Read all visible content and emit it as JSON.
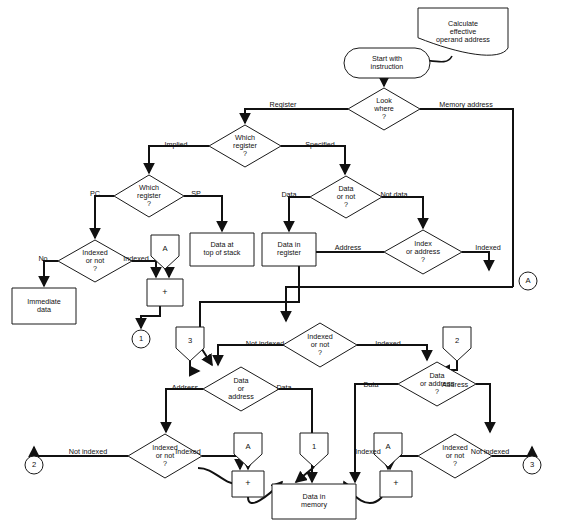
{
  "diagram": {
    "colors": {
      "stroke": "#111111",
      "fill": "#ffffff",
      "text": "#111111"
    },
    "nodes": [
      {
        "id": "note",
        "type": "note",
        "x": 418,
        "y": 8,
        "w": 90,
        "h": 48,
        "lines": [
          "Calculate",
          "effective",
          "operand address"
        ]
      },
      {
        "id": "start",
        "type": "terminator",
        "x": 344,
        "y": 48,
        "w": 86,
        "h": 30,
        "lines": [
          "Start with",
          "instruction"
        ]
      },
      {
        "id": "lookwhere",
        "type": "decision",
        "x": 348,
        "y": 88,
        "w": 72,
        "h": 42,
        "lines": [
          "Look",
          "where",
          "?"
        ]
      },
      {
        "id": "whichreg1",
        "type": "decision",
        "x": 209,
        "y": 125,
        "w": 72,
        "h": 42,
        "lines": [
          "Which",
          "register",
          "?"
        ]
      },
      {
        "id": "whichreg2",
        "type": "decision",
        "x": 114,
        "y": 175,
        "w": 70,
        "h": 42,
        "lines": [
          "Which",
          "register",
          "?"
        ]
      },
      {
        "id": "datornot",
        "type": "decision",
        "x": 310,
        "y": 176,
        "w": 72,
        "h": 42,
        "lines": [
          "Data",
          "or not",
          "?"
        ]
      },
      {
        "id": "idxornot1",
        "type": "decision",
        "x": 58,
        "y": 240,
        "w": 74,
        "h": 42,
        "lines": [
          "Indexed",
          "or not",
          "?"
        ]
      },
      {
        "id": "idxoraddr",
        "type": "decision",
        "x": 384,
        "y": 230,
        "w": 78,
        "h": 44,
        "lines": [
          "Index",
          "or address",
          "?"
        ]
      },
      {
        "id": "idxornot2",
        "type": "decision",
        "x": 283,
        "y": 323,
        "w": 74,
        "h": 44,
        "lines": [
          "Indexed",
          "or not",
          "?"
        ]
      },
      {
        "id": "dataoraddrL",
        "type": "decision",
        "x": 203,
        "y": 367,
        "w": 76,
        "h": 44,
        "lines": [
          "Data",
          "or",
          "address"
        ]
      },
      {
        "id": "dataoraddrR",
        "type": "decision",
        "x": 398,
        "y": 362,
        "w": 78,
        "h": 44,
        "lines": [
          "Data",
          "or address",
          "?"
        ]
      },
      {
        "id": "idxornot3",
        "type": "decision",
        "x": 128,
        "y": 434,
        "w": 74,
        "h": 44,
        "lines": [
          "Indexed",
          "or not",
          "?"
        ]
      },
      {
        "id": "idxornot4",
        "type": "decision",
        "x": 418,
        "y": 434,
        "w": 74,
        "h": 44,
        "lines": [
          "Indexed",
          "or not",
          "?"
        ]
      },
      {
        "id": "immediate",
        "type": "process",
        "x": 12,
        "y": 288,
        "w": 64,
        "h": 36,
        "lines": [
          "Immediate",
          "data"
        ]
      },
      {
        "id": "topstack",
        "type": "process",
        "x": 190,
        "y": 233,
        "w": 64,
        "h": 33,
        "lines": [
          "Data at",
          "top of stack"
        ]
      },
      {
        "id": "datareg",
        "type": "process",
        "x": 262,
        "y": 233,
        "w": 54,
        "h": 33,
        "lines": [
          "Data in",
          "register"
        ]
      },
      {
        "id": "datamem",
        "type": "process",
        "x": 272,
        "y": 484,
        "w": 84,
        "h": 35,
        "lines": [
          "Data in",
          "memory"
        ]
      },
      {
        "id": "adderA",
        "type": "adder",
        "x": 147,
        "y": 279,
        "w": 36,
        "h": 27,
        "lines": [
          "+"
        ]
      },
      {
        "id": "adderB",
        "type": "adder",
        "x": 232,
        "y": 471,
        "w": 32,
        "h": 26,
        "lines": [
          "+"
        ]
      },
      {
        "id": "adderC",
        "type": "adder",
        "x": 380,
        "y": 471,
        "w": 32,
        "h": 26,
        "lines": [
          "+"
        ]
      },
      {
        "id": "regA1",
        "type": "register",
        "x": 151,
        "y": 235,
        "w": 28,
        "h": 34,
        "lines": [
          "A"
        ]
      },
      {
        "id": "regA2",
        "type": "register",
        "x": 234,
        "y": 433,
        "w": 28,
        "h": 34,
        "lines": [
          "A"
        ]
      },
      {
        "id": "regA3",
        "type": "register",
        "x": 374,
        "y": 433,
        "w": 28,
        "h": 34,
        "lines": [
          "A"
        ]
      },
      {
        "id": "off3",
        "type": "register",
        "x": 176,
        "y": 327,
        "w": 28,
        "h": 34,
        "lines": [
          "3"
        ]
      },
      {
        "id": "off2",
        "type": "register",
        "x": 443,
        "y": 327,
        "w": 28,
        "h": 34,
        "lines": [
          "2"
        ]
      },
      {
        "id": "off1",
        "type": "register",
        "x": 300,
        "y": 433,
        "w": 28,
        "h": 34,
        "lines": [
          "1"
        ]
      },
      {
        "id": "conA1",
        "type": "connector",
        "x": 519,
        "y": 272,
        "w": 18,
        "h": 18,
        "lines": [
          "A"
        ]
      },
      {
        "id": "con1",
        "type": "connector",
        "x": 132,
        "y": 330,
        "w": 18,
        "h": 18,
        "lines": [
          "1"
        ]
      },
      {
        "id": "con2",
        "type": "connector",
        "x": 25,
        "y": 456,
        "w": 18,
        "h": 18,
        "lines": [
          "2"
        ]
      },
      {
        "id": "con3",
        "type": "connector",
        "x": 523,
        "y": 456,
        "w": 18,
        "h": 18,
        "lines": [
          "3"
        ]
      }
    ],
    "edge_labels": [
      {
        "id": "lbl-register",
        "text": "Register",
        "x": 283,
        "y": 105,
        "anchor": "middle"
      },
      {
        "id": "lbl-memaddress",
        "text": "Memory address",
        "x": 466,
        "y": 105,
        "anchor": "middle"
      },
      {
        "id": "lbl-implied",
        "text": "Implied",
        "x": 176,
        "y": 145,
        "anchor": "middle"
      },
      {
        "id": "lbl-specified",
        "text": "Specified",
        "x": 320,
        "y": 145,
        "anchor": "middle"
      },
      {
        "id": "lbl-pc",
        "text": "PC",
        "x": 95,
        "y": 194,
        "anchor": "middle"
      },
      {
        "id": "lbl-sp",
        "text": "SP",
        "x": 196,
        "y": 194,
        "anchor": "middle"
      },
      {
        "id": "lbl-data1",
        "text": "Data",
        "x": 289,
        "y": 195,
        "anchor": "middle"
      },
      {
        "id": "lbl-notdata",
        "text": "Not data",
        "x": 394,
        "y": 195,
        "anchor": "middle"
      },
      {
        "id": "lbl-no",
        "text": "No",
        "x": 43,
        "y": 259,
        "anchor": "middle"
      },
      {
        "id": "lbl-indexed1",
        "text": "Indexed",
        "x": 136,
        "y": 259,
        "anchor": "middle"
      },
      {
        "id": "lbl-address1",
        "text": "Address",
        "x": 348,
        "y": 248,
        "anchor": "middle"
      },
      {
        "id": "lbl-indexed2",
        "text": "Indexed",
        "x": 488,
        "y": 248,
        "anchor": "middle"
      },
      {
        "id": "lbl-notindexed1",
        "text": "Not indexed",
        "x": 265,
        "y": 344,
        "anchor": "middle"
      },
      {
        "id": "lbl-indexed3",
        "text": "Indexed",
        "x": 388,
        "y": 344,
        "anchor": "middle"
      },
      {
        "id": "lbl-address2",
        "text": "Address",
        "x": 185,
        "y": 388,
        "anchor": "middle"
      },
      {
        "id": "lbl-data2",
        "text": "Data",
        "x": 284,
        "y": 388,
        "anchor": "middle"
      },
      {
        "id": "lbl-data3",
        "text": "Data",
        "x": 371,
        "y": 385,
        "anchor": "middle"
      },
      {
        "id": "lbl-address3",
        "text": "Address",
        "x": 455,
        "y": 385,
        "anchor": "middle"
      },
      {
        "id": "lbl-notindexed2",
        "text": "Not indexed",
        "x": 88,
        "y": 452,
        "anchor": "middle"
      },
      {
        "id": "lbl-indexed4",
        "text": "Indexed",
        "x": 188,
        "y": 452,
        "anchor": "middle"
      },
      {
        "id": "lbl-indexed5",
        "text": "Indexed",
        "x": 368,
        "y": 452,
        "anchor": "middle"
      },
      {
        "id": "lbl-notindexed3",
        "text": "Not indexed",
        "x": 490,
        "y": 452,
        "anchor": "middle"
      }
    ],
    "connectors": [
      {
        "id": "note-to-start",
        "d": "M 452 56 C 448 64 440 62 424 60",
        "arrow": false,
        "thin": true
      },
      {
        "id": "start-lookwhere",
        "d": "M 384 78 L 384 86",
        "arrow": true
      },
      {
        "id": "lookwhere-register",
        "d": "M 348 109 L 245 109 L 245 123",
        "arrow": true
      },
      {
        "id": "lookwhere-memory",
        "d": "M 420 109 L 513 109 L 513 287",
        "arrow": false
      },
      {
        "id": "whichreg1-implied",
        "d": "M 209 146 L 149 146 L 149 173",
        "arrow": true
      },
      {
        "id": "whichreg1-specified",
        "d": "M 281 146 L 345 146 L 345 174",
        "arrow": true
      },
      {
        "id": "whichreg2-pc",
        "d": "M 114 196 L 95 196 L 95 238",
        "arrow": true
      },
      {
        "id": "whichreg2-sp",
        "d": "M 184 196 L 222 196 L 222 231",
        "arrow": true
      },
      {
        "id": "datornot-data",
        "d": "M 310 197 L 289 197 L 289 231",
        "arrow": true
      },
      {
        "id": "datornot-notdata",
        "d": "M 382 197 L 423 197 L 423 228",
        "arrow": true
      },
      {
        "id": "idx1-no",
        "d": "M 58 261 L 44 261 L 44 286",
        "arrow": true
      },
      {
        "id": "idx1-indexed",
        "d": "M 132 261 L 156 261 L 156 277",
        "arrow": true
      },
      {
        "id": "regA1-adder",
        "d": "M 169 269 L 169 277",
        "arrow": true
      },
      {
        "id": "adderA-con1",
        "d": "M 160 306 L 160 316 L 141 316 L 141 328",
        "arrow": true
      },
      {
        "id": "idxaddr-indexed",
        "d": "M 462 252 L 489 252 L 489 270",
        "arrow": true
      },
      {
        "id": "idxaddr-address",
        "d": "M 384 252 L 299 252 L 299 302 L 200 302 L 200 346 L 212 365",
        "arrow": true
      },
      {
        "id": "memaddr-down",
        "d": "M 513 287 L 286 287 L 286 321",
        "arrow": true
      },
      {
        "id": "idx2-notindexed",
        "d": "M 283 345 L 218 345 L 218 365",
        "arrow": true
      },
      {
        "id": "idx2-indexed",
        "d": "M 357 345 L 427 345 L 427 360",
        "arrow": true
      },
      {
        "id": "off3-in",
        "d": "M 190 361 L 190 371 L 199 371",
        "arrow": true
      },
      {
        "id": "off2-in",
        "d": "M 457 361 L 457 370 L 440 370",
        "arrow": true
      },
      {
        "id": "dataL-address",
        "d": "M 203 389 L 166 389 L 166 432",
        "arrow": true
      },
      {
        "id": "dataL-data",
        "d": "M 279 389 L 312 389 L 312 482",
        "arrow": true
      },
      {
        "id": "dataR-data",
        "d": "M 398 384 L 355 384 L 355 482",
        "arrow": true
      },
      {
        "id": "dataR-address",
        "d": "M 476 384 L 490 384 L 490 432",
        "arrow": true
      },
      {
        "id": "idx3-notindexed",
        "d": "M 128 456 L 34 456 L 34 447",
        "arrow": true
      },
      {
        "id": "idx3-indexed",
        "d": "M 202 456 L 240 456 L 240 469",
        "arrow": true
      },
      {
        "id": "idx4-indexed",
        "d": "M 418 456 L 390 456 L 390 469",
        "arrow": true
      },
      {
        "id": "idx4-notindexed",
        "d": "M 492 456 L 532 456 L 532 447",
        "arrow": true
      },
      {
        "id": "regA2-adderB",
        "d": "M 248 467 L 248 469",
        "arrow": true
      },
      {
        "id": "regA3-adderC",
        "d": "M 388 467 L 388 469",
        "arrow": true
      },
      {
        "id": "off1-datamem",
        "d": "M 314 467 L 296 482",
        "arrow": true
      },
      {
        "id": "adderB-curve",
        "d": "M 248 497 C 248 512 268 496 282 482",
        "arrow": true,
        "curve": true
      },
      {
        "id": "adderC-curve",
        "d": "M 382 497 C 368 512 352 496 344 482",
        "arrow": true,
        "curve": true
      },
      {
        "id": "leftwave-datamem",
        "d": "M 198 468 C 215 468 222 484 238 484 L 238 482",
        "arrow": false,
        "curve": true
      }
    ]
  }
}
